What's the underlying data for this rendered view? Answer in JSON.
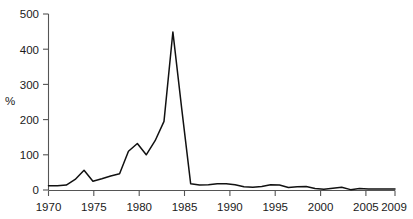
{
  "chart_data": {
    "type": "line",
    "title": "",
    "xlabel": "",
    "ylabel": "%",
    "xlim": [
      1970,
      2009
    ],
    "ylim": [
      0,
      500
    ],
    "grid": false,
    "legend": null,
    "y_ticks": [
      0,
      100,
      200,
      300,
      400,
      500
    ],
    "y_tick_labels": [
      "0",
      "100",
      "200",
      "300",
      "400",
      "500"
    ],
    "x_ticks": [
      1970,
      1975,
      1980,
      1985,
      1990,
      1995,
      2000,
      2005,
      2009
    ],
    "x_tick_labels": [
      "1970",
      "1975",
      "1980",
      "1985",
      "1990",
      "1995",
      "2000",
      "2005",
      "2009"
    ],
    "line_color": "#111111",
    "axis_color": "#555555",
    "x": [
      1970,
      1971,
      1972,
      1973,
      1974,
      1975,
      1976,
      1977,
      1978,
      1979,
      1980,
      1981,
      1982,
      1983,
      1984,
      1985,
      1986,
      1987,
      1988,
      1989,
      1990,
      1991,
      1992,
      1993,
      1994,
      1995,
      1996,
      1997,
      1998,
      1999,
      2000,
      2001,
      2002,
      2003,
      2004,
      2005,
      2006,
      2007,
      2008,
      2009
    ],
    "series": [
      {
        "name": "%",
        "values": [
          12,
          12,
          14,
          30,
          56,
          25,
          32,
          40,
          46,
          110,
          132,
          100,
          140,
          195,
          449,
          230,
          18,
          14,
          15,
          18,
          18,
          15,
          9,
          8,
          10,
          15,
          14,
          7,
          9,
          10,
          4,
          2,
          5,
          8,
          1,
          4,
          3,
          3,
          3,
          3
        ]
      }
    ]
  },
  "axes": {
    "y_axis_title": "%"
  }
}
